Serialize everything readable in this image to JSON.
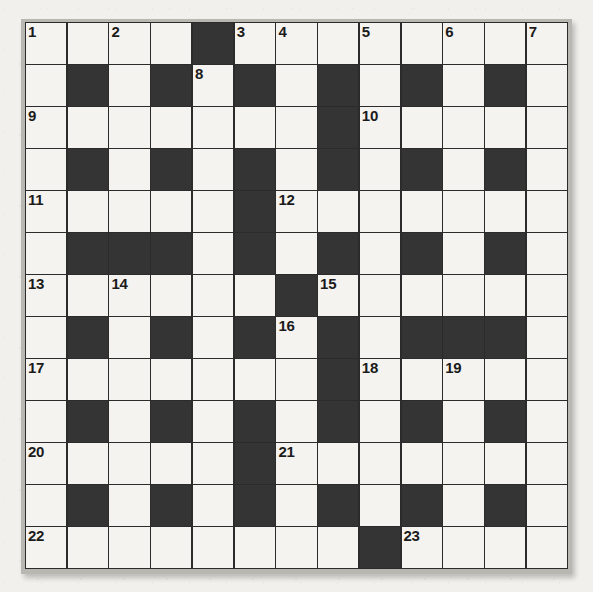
{
  "puzzle": {
    "type": "crossword-grid",
    "rows": 13,
    "columns": 13,
    "colors": {
      "page_background": "#f1f0ec",
      "white_cell": "#f4f3ef",
      "black_cell": "#343434",
      "grid_line": "#2b2b2b",
      "frame": "#b9b7b2",
      "number_text": "#1b1b1b"
    },
    "grid": [
      [
        "white",
        "white",
        "white",
        "white",
        "black",
        "white",
        "white",
        "white",
        "white",
        "white",
        "white",
        "white",
        "white"
      ],
      [
        "white",
        "black",
        "white",
        "black",
        "white",
        "black",
        "white",
        "black",
        "white",
        "black",
        "white",
        "black",
        "white"
      ],
      [
        "white",
        "white",
        "white",
        "white",
        "white",
        "white",
        "white",
        "black",
        "white",
        "white",
        "white",
        "white",
        "white"
      ],
      [
        "white",
        "black",
        "white",
        "black",
        "white",
        "black",
        "white",
        "black",
        "white",
        "black",
        "white",
        "black",
        "white"
      ],
      [
        "white",
        "white",
        "white",
        "white",
        "white",
        "black",
        "white",
        "white",
        "white",
        "white",
        "white",
        "white",
        "white"
      ],
      [
        "white",
        "black",
        "black",
        "black",
        "white",
        "black",
        "white",
        "black",
        "white",
        "black",
        "white",
        "black",
        "white"
      ],
      [
        "white",
        "white",
        "white",
        "white",
        "white",
        "white",
        "black",
        "white",
        "white",
        "white",
        "white",
        "white",
        "white"
      ],
      [
        "white",
        "black",
        "white",
        "black",
        "white",
        "black",
        "white",
        "black",
        "white",
        "black",
        "black",
        "black",
        "white"
      ],
      [
        "white",
        "white",
        "white",
        "white",
        "white",
        "white",
        "white",
        "black",
        "white",
        "white",
        "white",
        "white",
        "white"
      ],
      [
        "white",
        "black",
        "white",
        "black",
        "white",
        "black",
        "white",
        "black",
        "white",
        "black",
        "white",
        "black",
        "white"
      ],
      [
        "white",
        "white",
        "white",
        "white",
        "white",
        "black",
        "white",
        "white",
        "white",
        "white",
        "white",
        "white",
        "white"
      ],
      [
        "white",
        "black",
        "white",
        "black",
        "white",
        "black",
        "white",
        "black",
        "white",
        "black",
        "white",
        "black",
        "white"
      ],
      [
        "white",
        "white",
        "white",
        "white",
        "white",
        "white",
        "white",
        "white",
        "black",
        "white",
        "white",
        "white",
        "white"
      ]
    ],
    "numbers": [
      {
        "row": 1,
        "col": 1,
        "label": "1"
      },
      {
        "row": 1,
        "col": 3,
        "label": "2"
      },
      {
        "row": 1,
        "col": 6,
        "label": "3"
      },
      {
        "row": 1,
        "col": 7,
        "label": "4"
      },
      {
        "row": 1,
        "col": 9,
        "label": "5"
      },
      {
        "row": 1,
        "col": 11,
        "label": "6"
      },
      {
        "row": 1,
        "col": 13,
        "label": "7"
      },
      {
        "row": 2,
        "col": 5,
        "label": "8"
      },
      {
        "row": 3,
        "col": 1,
        "label": "9"
      },
      {
        "row": 3,
        "col": 9,
        "label": "10"
      },
      {
        "row": 5,
        "col": 1,
        "label": "11"
      },
      {
        "row": 5,
        "col": 7,
        "label": "12"
      },
      {
        "row": 7,
        "col": 1,
        "label": "13"
      },
      {
        "row": 7,
        "col": 3,
        "label": "14"
      },
      {
        "row": 7,
        "col": 8,
        "label": "15"
      },
      {
        "row": 8,
        "col": 7,
        "label": "16"
      },
      {
        "row": 9,
        "col": 1,
        "label": "17"
      },
      {
        "row": 9,
        "col": 9,
        "label": "18"
      },
      {
        "row": 9,
        "col": 11,
        "label": "19"
      },
      {
        "row": 11,
        "col": 1,
        "label": "20"
      },
      {
        "row": 11,
        "col": 7,
        "label": "21"
      },
      {
        "row": 13,
        "col": 1,
        "label": "22"
      },
      {
        "row": 13,
        "col": 10,
        "label": "23"
      }
    ]
  }
}
